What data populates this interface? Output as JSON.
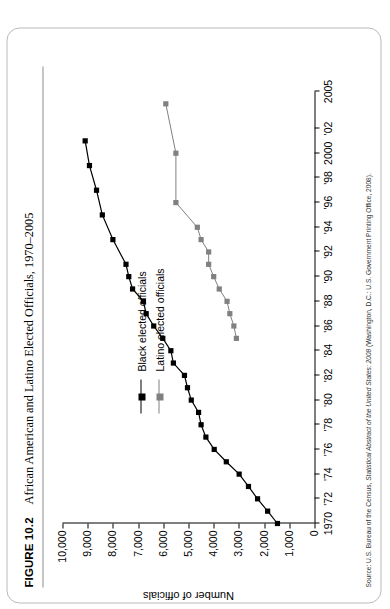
{
  "figure": {
    "number": "FIGURE 10.2",
    "title": "African American and Latino Elected Officials, 1970–2005",
    "source": "Source: U.S. Bureau of the Census, Statistical Abstract of the United States: 2008 (Washington, D.C.: U.S. Government Printing Office, 2008)."
  },
  "colors": {
    "black_series": "#000000",
    "latino_series": "#808080",
    "axis": "#000000",
    "frame": "#b9b9b9"
  },
  "chart_data": {
    "type": "line",
    "title": "African American and Latino Elected Officials, 1970–2005",
    "xlabel": "",
    "ylabel": "Number of officials",
    "xlim": [
      1970,
      2005
    ],
    "ylim": [
      0,
      10000
    ],
    "grid": false,
    "legend_position": "top-left",
    "ytick_values": [
      0,
      1000,
      2000,
      3000,
      4000,
      5000,
      6000,
      7000,
      8000,
      9000,
      10000
    ],
    "ytick_labels": [
      "0",
      "1,000",
      "2,000",
      "3,000",
      "4,000",
      "5,000",
      "6,000",
      "7,000",
      "8,000",
      "9,000",
      "10,000"
    ],
    "xtick_values": [
      1970,
      1972,
      1974,
      1976,
      1978,
      1980,
      1982,
      1984,
      1986,
      1988,
      1990,
      1992,
      1994,
      1996,
      1998,
      2000,
      2002,
      2005
    ],
    "xtick_labels": [
      "1970",
      "'72",
      "'74",
      "'76",
      "'78",
      "'80",
      "'82",
      "'84",
      "'86",
      "'88",
      "'90",
      "'92",
      "'94",
      "'96",
      "'98",
      "2000",
      "'02",
      "2005"
    ],
    "series": [
      {
        "name": "Black elected officials",
        "color": "#000000",
        "marker": "square",
        "x": [
          1970,
          1971,
          1972,
          1973,
          1974,
          1975,
          1976,
          1977,
          1978,
          1979,
          1980,
          1981,
          1982,
          1983,
          1984,
          1985,
          1986,
          1987,
          1988,
          1989,
          1990,
          1991,
          1993,
          1995,
          1997,
          1999,
          2001
        ],
        "y": [
          1470,
          1860,
          2260,
          2620,
          2990,
          3500,
          3980,
          4310,
          4500,
          4600,
          4890,
          5040,
          5160,
          5600,
          5700,
          6020,
          6380,
          6680,
          6790,
          7220,
          7370,
          7480,
          8000,
          8420,
          8650,
          8930,
          9100
        ]
      },
      {
        "name": "Latino elected officials",
        "color": "#808080",
        "marker": "square",
        "x": [
          1985,
          1986,
          1987,
          1988,
          1989,
          1990,
          1991,
          1992,
          1993,
          1994,
          1996,
          2000,
          2004
        ],
        "y": [
          3100,
          3200,
          3360,
          3470,
          3780,
          4000,
          4200,
          4200,
          4500,
          4650,
          5500,
          5500,
          5900
        ]
      }
    ]
  },
  "legend": {
    "items": [
      {
        "label": "Black elected officials",
        "color": "#000000"
      },
      {
        "label": "Latino elected officials",
        "color": "#808080"
      }
    ]
  }
}
